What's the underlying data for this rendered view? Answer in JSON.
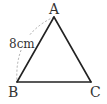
{
  "diagram": {
    "type": "triangle",
    "vertices": [
      {
        "name": "A",
        "x": 54,
        "y": 17
      },
      {
        "name": "B",
        "x": 17,
        "y": 82
      },
      {
        "name": "C",
        "x": 91,
        "y": 82
      }
    ],
    "labels": {
      "A": "A",
      "B": "B",
      "C": "C"
    },
    "side_measure": {
      "side": "AB",
      "text": "8cm",
      "style": "dashed-arc"
    },
    "colors": {
      "line": "#222222",
      "arc": "#aaaaaa",
      "text": "#333333"
    }
  }
}
